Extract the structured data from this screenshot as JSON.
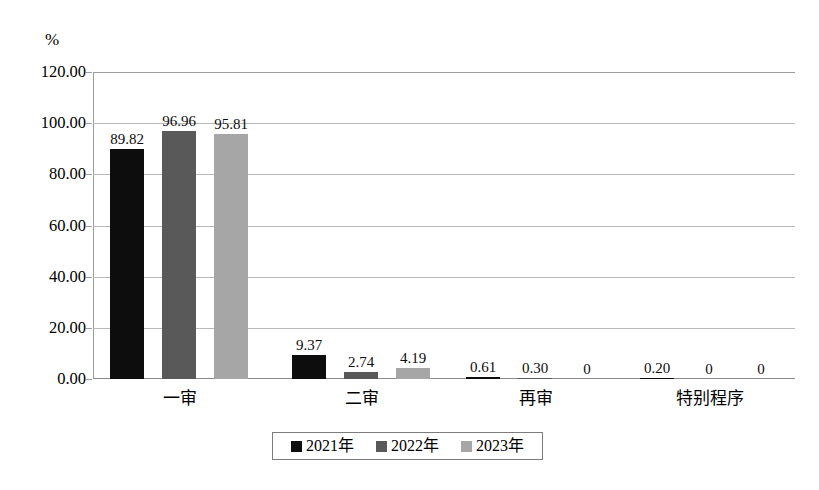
{
  "chart_data": {
    "type": "bar",
    "title": "",
    "subtitle": "",
    "xlabel": "",
    "ylabel": "%",
    "unit_label": "%",
    "categories": [
      "一审",
      "二审",
      "再审",
      "特别程序"
    ],
    "series": [
      {
        "name": "2021年",
        "color": "#0d0d0d",
        "values": [
          89.82,
          9.37,
          0.61,
          0.2
        ],
        "labels": [
          "89.82",
          "9.37",
          "0.61",
          "0.20"
        ]
      },
      {
        "name": "2022年",
        "color": "#595959",
        "values": [
          96.96,
          2.74,
          0.3,
          0
        ],
        "labels": [
          "96.96",
          "2.74",
          "0.30",
          "0"
        ]
      },
      {
        "name": "2023年",
        "color": "#a6a6a6",
        "values": [
          95.81,
          4.19,
          0,
          0
        ],
        "labels": [
          "95.81",
          "4.19",
          "0",
          "0"
        ]
      }
    ],
    "ylim": [
      0,
      120
    ],
    "ytick_values": [
      0,
      20,
      40,
      60,
      80,
      100,
      120
    ],
    "ytick_labels": [
      "0.00",
      "20.00",
      "40.00",
      "60.00",
      "80.00",
      "100.00",
      "120.00"
    ],
    "grid": true,
    "legend_position": "bottom-center",
    "legend_entries": [
      "2021年",
      "2022年",
      "2023年"
    ]
  }
}
